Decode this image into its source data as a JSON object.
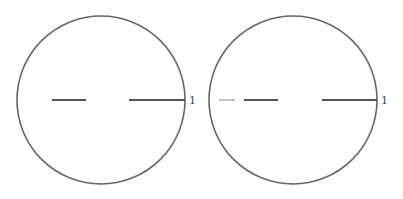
{
  "figures": [
    {
      "name": "left-circle",
      "center": [
        101,
        100
      ],
      "radius": 84,
      "segments": [
        {
          "x1": 52,
          "x2": 86,
          "y": 100,
          "color": "#555555"
        },
        {
          "x1": 129,
          "x2": 185,
          "y": 100,
          "color": "#555555"
        }
      ],
      "label": "1",
      "label_pos": [
        189,
        104
      ]
    },
    {
      "name": "right-circle",
      "center": [
        293,
        100
      ],
      "radius": 84,
      "segments": [
        {
          "x1": 219,
          "x2": 235,
          "y": 100,
          "color": "#bbbbbb"
        },
        {
          "x1": 244,
          "x2": 278,
          "y": 100,
          "color": "#555555"
        },
        {
          "x1": 322,
          "x2": 377,
          "y": 100,
          "color": "#555555"
        }
      ],
      "label": "1",
      "label_pos": [
        381,
        104
      ]
    }
  ],
  "colors": {
    "stroke": "#666666",
    "background": "#ffffff"
  }
}
